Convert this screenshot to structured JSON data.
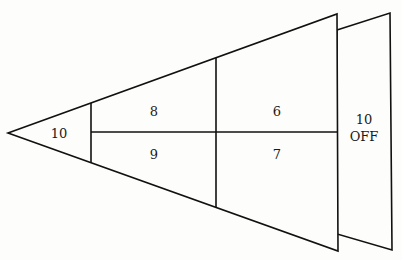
{
  "diagram": {
    "title": "",
    "target": {
      "front_section": {
        "tip": {
          "label": "10"
        },
        "upper_inner": {
          "label": "8"
        },
        "upper_outer": {
          "label": "6"
        },
        "lower_inner": {
          "label": "9"
        },
        "lower_outer": {
          "label": "7"
        }
      },
      "back_panel": {
        "line1": "10",
        "line2": "OFF"
      }
    },
    "colors": {
      "line": "#111111",
      "background": "#fdfdfb",
      "text": "#1a1a1a"
    }
  }
}
